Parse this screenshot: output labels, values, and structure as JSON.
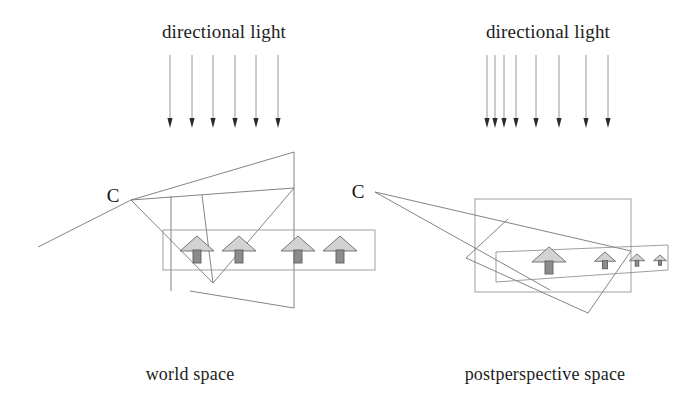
{
  "figure": {
    "panels": [
      {
        "id": "world-space",
        "heading": "directional light",
        "caption": "world space",
        "camera_label": "C",
        "camera_point": {
          "x": 131,
          "y": 200
        },
        "camera_text_pos": {
          "x": 113,
          "y": 202
        },
        "heading_pos": {
          "x": 224,
          "y": 38
        },
        "caption_pos": {
          "x": 190,
          "y": 380
        },
        "light": {
          "type": "parallel",
          "arrow_count": 6,
          "top_y": 55,
          "tip_y": 128,
          "x_positions": [
            170,
            192,
            213,
            235,
            256,
            278
          ],
          "spacing": "uniform"
        },
        "ground_box": {
          "x": 163,
          "y": 230,
          "width": 212,
          "height": 40
        },
        "view_frustum_outline": [
          [
            38,
            247
          ],
          [
            131,
            200
          ],
          [
            294,
            152
          ],
          [
            294,
            308
          ],
          [
            190,
            291
          ]
        ],
        "frustum_lines": [
          {
            "from": [
              131,
              200
            ],
            "to": [
              213,
              283
            ]
          },
          {
            "from": [
              131,
              200
            ],
            "to": [
              294,
              188
            ]
          },
          {
            "from": [
              171,
              196
            ],
            "to": [
              171,
              291
            ]
          },
          {
            "from": [
              202,
              195
            ],
            "to": [
              213,
              283
            ]
          },
          {
            "from": [
              294,
              188
            ],
            "to": [
              213,
              283
            ]
          }
        ],
        "houses": [
          {
            "x": 197,
            "y": 236,
            "scale": 1.0
          },
          {
            "x": 239,
            "y": 236,
            "scale": 1.0
          },
          {
            "x": 298,
            "y": 236,
            "scale": 1.0
          },
          {
            "x": 340,
            "y": 236,
            "scale": 1.0
          }
        ]
      },
      {
        "id": "postperspective-space",
        "heading": "directional light",
        "caption": "postperspective space",
        "camera_label": "C",
        "camera_point": {
          "x": 375,
          "y": 192
        },
        "camera_text_pos": {
          "x": 358,
          "y": 198
        },
        "heading_pos": {
          "x": 548,
          "y": 38
        },
        "caption_pos": {
          "x": 545,
          "y": 380
        },
        "light": {
          "type": "converged",
          "arrow_count": 8,
          "top_y": 55,
          "tip_y": 128,
          "x_positions": [
            487,
            495,
            504,
            516,
            536,
            559,
            586,
            608
          ],
          "spacing": "non-uniform-widening"
        },
        "unit_box": {
          "x": 475,
          "y": 199,
          "width": 156,
          "height": 93
        },
        "warped_ground_strip": [
          [
            496,
            252
          ],
          [
            668,
            245
          ],
          [
            668,
            270
          ],
          [
            496,
            282
          ]
        ],
        "frustum_lines": [
          {
            "from": [
              375,
              192
            ],
            "to": [
              631,
              251
            ]
          },
          {
            "from": [
              375,
              192
            ],
            "to": [
              550,
              290
            ]
          },
          {
            "from": [
              508,
              219
            ],
            "to": [
              466,
              258
            ]
          },
          {
            "from": [
              466,
              258
            ],
            "to": [
              588,
              313
            ]
          },
          {
            "from": [
              588,
              313
            ],
            "to": [
              631,
              251
            ]
          }
        ],
        "houses": [
          {
            "x": 549,
            "y": 247,
            "scale": 1.0
          },
          {
            "x": 605,
            "y": 252,
            "scale": 0.62
          },
          {
            "x": 637,
            "y": 254,
            "scale": 0.45
          },
          {
            "x": 660,
            "y": 255,
            "scale": 0.38
          }
        ]
      }
    ],
    "colors": {
      "ink": "#1c1c1c",
      "geometry_line": "#6e6e6e",
      "box_line": "#8d8d8d",
      "ray_line": "#8a8a8a",
      "arrow_head": "#2b2b2b",
      "house_roof_fill": "#d2d2d2",
      "house_body_fill": "#8c8c8c",
      "house_outline": "#6a6a6a",
      "background": "#ffffff"
    }
  }
}
